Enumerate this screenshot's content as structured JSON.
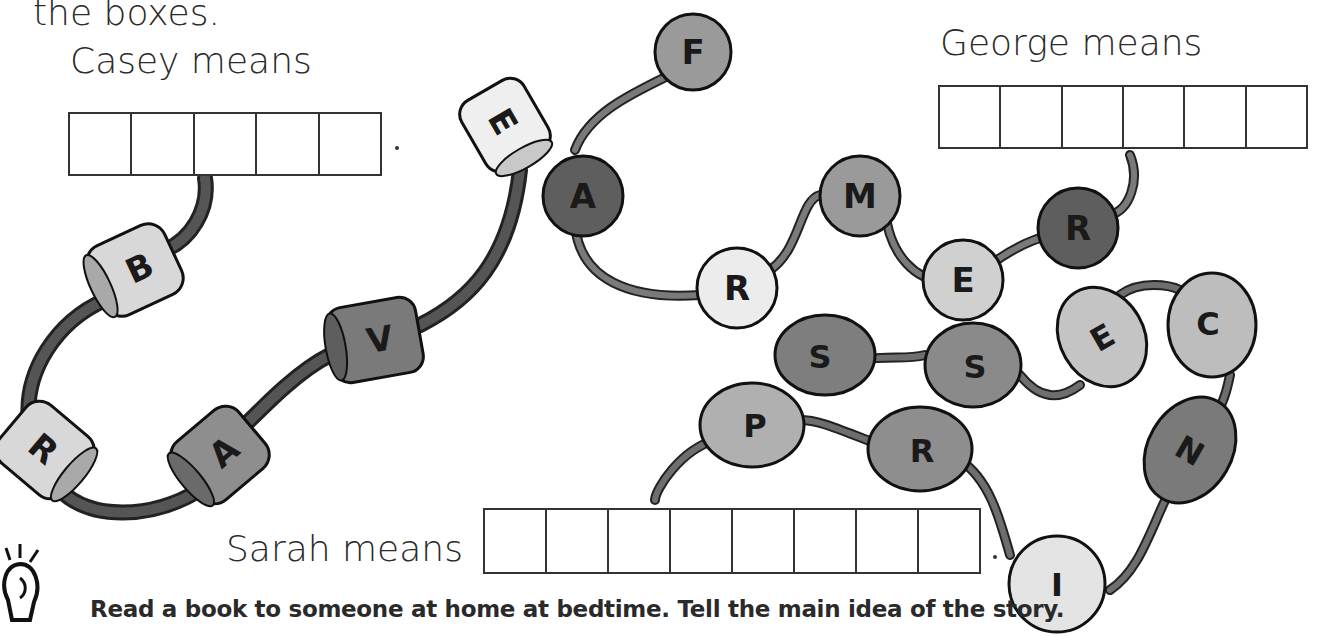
{
  "instructions": {
    "text_fragment": "the boxes."
  },
  "puzzles": [
    {
      "id": "casey",
      "label": "Casey means",
      "box_count": 5,
      "bead_letters": [
        "B",
        "R",
        "A",
        "V",
        "E"
      ],
      "bead_shape": "cylinder",
      "punctuation": "."
    },
    {
      "id": "george",
      "label": "George means",
      "box_count": 6,
      "bead_letters": [
        "F",
        "A",
        "R",
        "M",
        "E",
        "R"
      ],
      "bead_shape": "circle",
      "punctuation": ""
    },
    {
      "id": "sarah",
      "label": "Sarah means",
      "box_count": 8,
      "bead_letters": [
        "S",
        "S",
        "E",
        "C",
        "N",
        "I",
        "R",
        "P"
      ],
      "bead_shape": "oval",
      "punctuation": "."
    }
  ],
  "tip": {
    "icon": "lightbulb-icon",
    "text": "Read a book to someone at home at bedtime. Tell the main idea of the story."
  },
  "colors": {
    "ink": "#2a2a2a",
    "cord_dark": "#4a4a4a",
    "cord_mid": "#6e6e6e",
    "bead_light": "#d8d8d8",
    "bead_mid": "#9a9a9a",
    "bead_dark": "#6a6a6a",
    "bead_pale": "#ececec"
  }
}
